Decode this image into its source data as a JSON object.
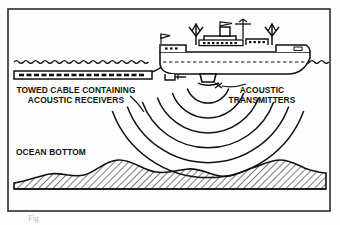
{
  "figure": {
    "type": "technical-line-diagram",
    "background_color": "#fdfdfd",
    "ink_color": "#111111",
    "border": {
      "name": "figure-border",
      "x": 8,
      "y": 9,
      "width": 322,
      "height": 202,
      "stroke": "#2b2b2b",
      "stroke_width": 1.6
    },
    "labels": [
      {
        "id": "towed-cable",
        "lines": [
          "TOWED CABLE CONTAINING",
          "ACOUSTIC RECEIVERS"
        ],
        "line1": "TOWED CABLE CONTAINING",
        "line2": "ACOUSTIC RECEIVERS",
        "x": 76,
        "y": 93,
        "anchor": "middle"
      },
      {
        "id": "acoustic-transmitters",
        "lines": [
          "ACOUSTIC",
          "TRANSMITTERS"
        ],
        "line1": "ACOUSTIC",
        "line2": "TRANSMITTERS",
        "x": 262,
        "y": 93,
        "anchor": "middle"
      },
      {
        "id": "ocean-bottom",
        "lines": [
          "OCEAN BOTTOM"
        ],
        "line1": "OCEAN BOTTOM",
        "x": 16,
        "y": 155,
        "anchor": "start"
      }
    ],
    "caption": {
      "text": "Fig.",
      "note": "cropped-illegible",
      "x": 28,
      "y": 221
    },
    "elements": {
      "sea_surface": {
        "name": "sea-surface-wavy-line",
        "y": 62
      },
      "towed_cable": {
        "name": "towed-cable-body",
        "x": 14,
        "y": 71,
        "width": 138,
        "height": 8,
        "receiver_count": 19
      },
      "ship": {
        "name": "survey-ship",
        "hull_left": 152,
        "hull_right": 308,
        "deck_y": 52,
        "keel_y": 72,
        "derricks": 2,
        "funnel": 1,
        "masts": 1,
        "flags": 2
      },
      "transmitters": {
        "name": "acoustic-transmitter-pods",
        "count": 2,
        "origin_x": 208,
        "origin_y": 80
      },
      "acoustic_waves": {
        "name": "acoustic-wavefronts",
        "count": 6,
        "radii": [
          22,
          38,
          54,
          70,
          86,
          102
        ],
        "center_x": 208,
        "center_y": 80,
        "start_angle_deg": 200,
        "end_angle_deg": 340
      },
      "ocean_bottom": {
        "name": "ocean-bottom-terrain",
        "baseline_y": 188,
        "hatch_angle_deg": 45
      }
    }
  }
}
